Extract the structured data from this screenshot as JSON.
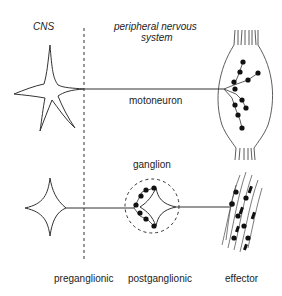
{
  "diagram": {
    "labels": {
      "cns": "CNS",
      "pns_line1": "peripheral nervous",
      "pns_line2": "system",
      "motoneuron": "motoneuron",
      "ganglion": "ganglion",
      "preganglionic": "preganglionic",
      "postganglionic": "postganglionic",
      "effector": "effector"
    },
    "colors": {
      "stroke": "#333333",
      "dots": "#111111",
      "background": "#ffffff"
    },
    "elements": [
      {
        "name": "cns-pns-boundary",
        "type": "dashed-line"
      },
      {
        "name": "motoneuron-cell-body",
        "type": "star-soma",
        "region": "CNS"
      },
      {
        "name": "motoneuron-axon",
        "type": "line"
      },
      {
        "name": "skeletal-muscle",
        "type": "spindle",
        "terminals": 10
      },
      {
        "name": "preganglionic-cell-body",
        "type": "star-soma",
        "region": "CNS"
      },
      {
        "name": "preganglionic-axon",
        "type": "line"
      },
      {
        "name": "ganglion-circle",
        "type": "dashed-circle"
      },
      {
        "name": "postganglionic-cell-body",
        "type": "star-soma"
      },
      {
        "name": "postganglionic-axon",
        "type": "line"
      },
      {
        "name": "smooth-muscle-effector",
        "type": "fibers"
      }
    ]
  }
}
